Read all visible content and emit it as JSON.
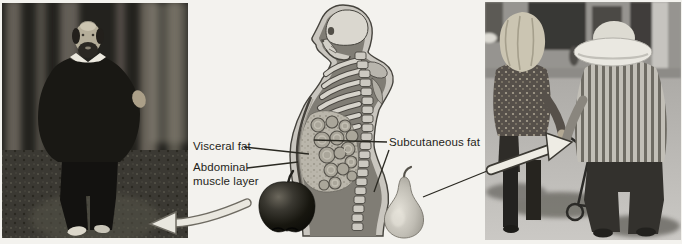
{
  "figure": {
    "background_color": "#f3f2ee",
    "diagram": {
      "labels": {
        "visceral_fat": "Visceral fat",
        "abdominal_muscle_layer": "Abdominal muscle layer",
        "subcutaneous_fat": "Subcutaneous fat"
      },
      "label_color": "#1f1e1a",
      "leader_line_color": "#2a2922"
    },
    "panels": {
      "left_photo": {
        "description": "Grayscale photo: man with abdominal (apple-shape) fat pattern walking on a wooded path"
      },
      "center_diagram": {
        "description": "Side-view torso diagram showing visceral fat inside the abdomen and subcutaneous fat under the skin"
      },
      "right_photo": {
        "description": "Grayscale photo: woman with lower-body (pear-shape) fat pattern walking outdoors"
      }
    },
    "icons": {
      "apple_shape": "apple-icon",
      "pear_shape": "pear-icon",
      "left_arrow": "arrow-left-icon",
      "right_arrow": "arrow-right-icon"
    }
  }
}
